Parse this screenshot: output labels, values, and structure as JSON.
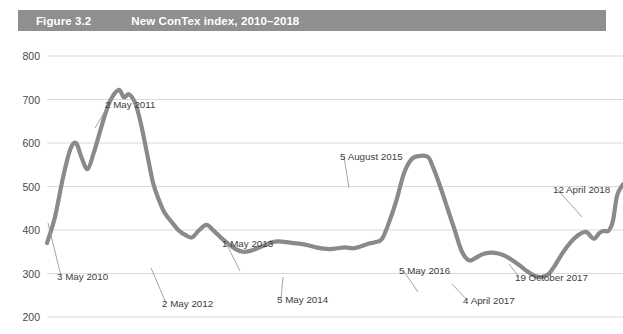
{
  "header": {
    "figure_number": "Figure 3.2",
    "title": "New ConTex index, 2010–2018",
    "band_color": "#8f8f8f",
    "text_color": "#ffffff"
  },
  "chart_data": {
    "type": "line",
    "title": "New ConTex index, 2010–2018",
    "xlabel": "",
    "ylabel": "",
    "ylim": [
      200,
      800
    ],
    "yticks": [
      200,
      300,
      400,
      500,
      600,
      700,
      800
    ],
    "ytick_labels": [
      "200",
      "300",
      "400",
      "500",
      "600",
      "700",
      "800"
    ],
    "grid": true,
    "legend": "none",
    "line_color": "#8a8a8a",
    "xlim": [
      2010.34,
      2018.28
    ],
    "series": [
      {
        "name": "New ConTex index",
        "x": [
          2010.34,
          2010.45,
          2010.56,
          2010.66,
          2010.74,
          2010.82,
          2010.9,
          2010.98,
          2011.06,
          2011.14,
          2011.22,
          2011.33,
          2011.4,
          2011.47,
          2011.56,
          2011.64,
          2011.72,
          2011.8,
          2011.88,
          2011.96,
          2012.06,
          2012.15,
          2012.25,
          2012.34,
          2012.44,
          2012.54,
          2012.64,
          2012.74,
          2012.84,
          2012.94,
          2013.04,
          2013.14,
          2013.24,
          2013.33,
          2013.44,
          2013.54,
          2013.64,
          2013.74,
          2013.84,
          2013.94,
          2014.05,
          2014.15,
          2014.25,
          2014.34,
          2014.45,
          2014.56,
          2014.66,
          2014.76,
          2014.86,
          2014.96,
          2015.06,
          2015.16,
          2015.26,
          2015.36,
          2015.46,
          2015.59,
          2015.66,
          2015.76,
          2015.86,
          2015.96,
          2016.06,
          2016.16,
          2016.25,
          2016.34,
          2016.45,
          2016.56,
          2016.66,
          2016.76,
          2016.86,
          2016.96,
          2017.06,
          2017.16,
          2017.26,
          2017.34,
          2017.45,
          2017.56,
          2017.66,
          2017.76,
          2017.8,
          2017.88,
          2017.96,
          2018.02,
          2018.08,
          2018.14,
          2018.2,
          2018.28
        ],
        "y": [
          370,
          430,
          520,
          585,
          600,
          565,
          540,
          575,
          620,
          665,
          700,
          722,
          705,
          712,
          690,
          640,
          575,
          510,
          470,
          440,
          418,
          400,
          388,
          383,
          400,
          412,
          398,
          382,
          368,
          356,
          350,
          352,
          358,
          364,
          372,
          374,
          372,
          370,
          368,
          365,
          360,
          357,
          356,
          358,
          360,
          358,
          362,
          368,
          372,
          380,
          420,
          470,
          530,
          562,
          570,
          568,
          545,
          500,
          450,
          400,
          350,
          330,
          336,
          344,
          348,
          346,
          340,
          330,
          318,
          305,
          295,
          292,
          300,
          318,
          348,
          372,
          388,
          396,
          392,
          380,
          394,
          398,
          398,
          420,
          480,
          505
        ]
      }
    ],
    "annotations": [
      {
        "label": "3 May 2010",
        "value": 370,
        "date": "3 May 2010"
      },
      {
        "label": "2 May 2011",
        "value": 722,
        "date": "2 May 2011"
      },
      {
        "label": "2 May 2012",
        "value": 383,
        "date": "2 May 2012"
      },
      {
        "label": "1 May 2013",
        "value": 364,
        "date": "1 May 2013"
      },
      {
        "label": "5 May 2014",
        "value": 358,
        "date": "5 May 2014"
      },
      {
        "label": "5 August 2015",
        "value": 570,
        "date": "5 August 2015"
      },
      {
        "label": "5 May 2016",
        "value": 348,
        "date": "5 May 2016"
      },
      {
        "label": "4 April 2017",
        "value": 292,
        "date": "4 April 2017"
      },
      {
        "label": "19 October 2017",
        "value": 392,
        "date": "19 October 2017"
      },
      {
        "label": "12 April 2018",
        "value": 505,
        "date": "12 April 2018"
      }
    ]
  }
}
